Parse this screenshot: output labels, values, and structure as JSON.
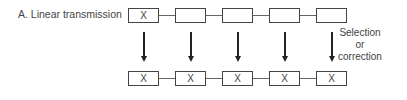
{
  "diagram": {
    "label": "A. Linear transmission",
    "top_row": [
      {
        "text": "X"
      },
      {
        "text": ""
      },
      {
        "text": ""
      },
      {
        "text": ""
      },
      {
        "text": ""
      }
    ],
    "bottom_row": [
      {
        "text": "X"
      },
      {
        "text": "X"
      },
      {
        "text": "X"
      },
      {
        "text": "X"
      },
      {
        "text": "X"
      }
    ],
    "note_lines": [
      "Selection",
      "or",
      "correction"
    ]
  }
}
